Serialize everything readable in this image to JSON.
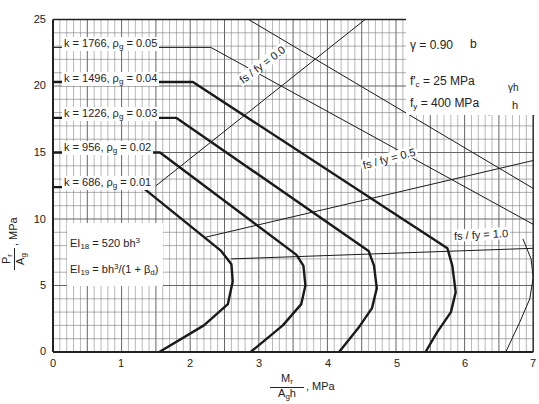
{
  "chart_data": {
    "type": "line",
    "title": "",
    "xlabel": "M_r / (A_g h), MPa",
    "ylabel": "P_r / A_g, MPa",
    "xlim": [
      0,
      7
    ],
    "ylim": [
      0,
      25
    ],
    "x_ticks": [
      0,
      1,
      2,
      3,
      4,
      5,
      6,
      7
    ],
    "y_ticks": [
      0,
      5,
      10,
      15,
      20,
      25
    ],
    "grid": {
      "on": true,
      "x_minor": 0.1,
      "y_minor": 1
    },
    "series": [
      {
        "name": "k = 686, ρg = 0.01",
        "k": "686",
        "rho": "0.01",
        "weight": "bold",
        "points": [
          [
            0,
            12.4
          ],
          [
            1.3,
            12.4
          ],
          [
            2.45,
            7.6
          ],
          [
            2.6,
            6.6
          ],
          [
            2.62,
            5.3
          ],
          [
            2.55,
            3.6
          ],
          [
            2.2,
            2.0
          ],
          [
            1.55,
            0
          ]
        ]
      },
      {
        "name": "k = 956, ρg = 0.02",
        "k": "956",
        "rho": "0.02",
        "weight": "bold",
        "points": [
          [
            0,
            15.0
          ],
          [
            1.56,
            15.0
          ],
          [
            3.55,
            7.3
          ],
          [
            3.65,
            6.5
          ],
          [
            3.68,
            5.0
          ],
          [
            3.62,
            3.6
          ],
          [
            3.35,
            2.0
          ],
          [
            2.88,
            0
          ]
        ]
      },
      {
        "name": "k = 1226, ρg = 0.03",
        "k": "1226",
        "rho": "0.03",
        "weight": "bold",
        "points": [
          [
            0,
            17.6
          ],
          [
            1.8,
            17.6
          ],
          [
            4.6,
            7.6
          ],
          [
            4.68,
            6.5
          ],
          [
            4.72,
            4.8
          ],
          [
            4.65,
            3.3
          ],
          [
            4.45,
            1.8
          ],
          [
            4.17,
            0
          ]
        ]
      },
      {
        "name": "k = 1496, ρg = 0.04",
        "k": "1496",
        "rho": "0.04",
        "weight": "bold",
        "points": [
          [
            0,
            20.3
          ],
          [
            2.04,
            20.3
          ],
          [
            5.75,
            7.8
          ],
          [
            5.82,
            6.5
          ],
          [
            5.87,
            4.5
          ],
          [
            5.8,
            3.0
          ],
          [
            5.6,
            1.5
          ],
          [
            5.43,
            0
          ]
        ]
      },
      {
        "name": "k = 1766, ρg = 0.05",
        "k": "1766",
        "rho": "0.05",
        "weight": "thin",
        "points": [
          [
            0,
            22.9
          ],
          [
            2.3,
            22.9
          ],
          [
            7.0,
            9.6
          ]
        ]
      },
      {
        "name": "upper boundary",
        "weight": "thin",
        "points": [
          [
            2.85,
            25
          ],
          [
            7.0,
            12.3
          ]
        ]
      },
      {
        "name": "k = 1766 lower branch",
        "weight": "thin",
        "points": [
          [
            6.85,
            8.5
          ],
          [
            6.97,
            7.0
          ],
          [
            7.0,
            5.6
          ],
          [
            6.95,
            4.0
          ],
          [
            6.8,
            2.2
          ],
          [
            6.6,
            0
          ]
        ]
      },
      {
        "name": "fs / fy = 0.0",
        "weight": "thin",
        "points": [
          [
            1.5,
            12.5
          ],
          [
            4.55,
            25
          ]
        ]
      },
      {
        "name": "fs / fy = 0.5",
        "weight": "thin",
        "points": [
          [
            2.2,
            8.6
          ],
          [
            7.0,
            14.4
          ]
        ]
      },
      {
        "name": "fs / fy = 1.0",
        "weight": "thin",
        "points": [
          [
            2.6,
            7.0
          ],
          [
            7.0,
            7.8
          ]
        ]
      }
    ],
    "annotations": [
      {
        "text": "fs / fy = 0.0",
        "x": 2.8,
        "y": 15.5,
        "rotation": -37
      },
      {
        "text": "fs / fy = 0.5",
        "x": 5.3,
        "y": 13.5,
        "rotation": -14
      },
      {
        "text": "fs / fy = 1.0",
        "x": 6.15,
        "y": 8.2,
        "rotation": -3
      }
    ]
  },
  "labels": {
    "k686": "k =  686,  ρ",
    "k956": "k =  956,  ρ",
    "k1226": "k = 1226,  ρ",
    "k1496": "k = 1496,  ρ",
    "k1766": "k = 1766,  ρ",
    "g": "g",
    "r686": " = 0.01",
    "r956": " = 0.02",
    "r1226": " = 0.03",
    "r1496": " = 0.04",
    "r1766": " = 0.05",
    "fs00": "f",
    "ei18_a": "EI",
    "ei18_sub": "18",
    "ei18_b": " = 520 bh",
    "ei18_sup": "3",
    "ei19_a": "EI",
    "ei19_sub": "19",
    "ei19_b": " = bh",
    "ei19_sup": "3",
    "ei19_c": "/(1 + β",
    "ei19_d": "d",
    "ei19_e": ")",
    "gamma": "γ  =  0.90",
    "fc": "f′",
    "fc_sub": "c",
    "fc_val": " =   25  MPa",
    "fy": "f",
    "fy_sub": "y",
    "fy_val": " = 400  MPa",
    "dim_b": "b",
    "dim_gh": "γh",
    "dim_h": "h",
    "xlabel_num": "M",
    "xlabel_num_sub": "r",
    "xlabel_den": "A",
    "xlabel_den_sub": "g",
    "xlabel_den_h": "h",
    "xlabel_unit": ", MPa",
    "ylabel_num": "P",
    "ylabel_num_sub": "r",
    "ylabel_den": "A",
    "ylabel_den_sub": "g",
    "ylabel_unit": ", MPa",
    "lbl_fs00": "fs / fy = 0.0",
    "lbl_fs05": "fs / fy = 0.5",
    "lbl_fs10": "fs / fy = 1.0"
  },
  "ticks": {
    "x": [
      "0",
      "1",
      "2",
      "3",
      "4",
      "5",
      "6",
      "7"
    ],
    "y": [
      "0",
      "5",
      "10",
      "15",
      "20",
      "25"
    ]
  }
}
